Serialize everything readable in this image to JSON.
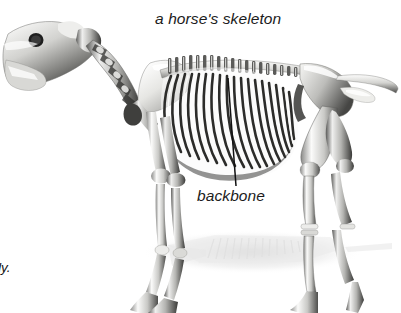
{
  "figure": {
    "title": "a horse's skeleton",
    "background_color": "#ffffff",
    "style": "grayscale 3D rendering"
  },
  "labels": {
    "backbone": "backbone"
  },
  "page_text_fragments": {
    "body_line": "ody.",
    "skeleton_line": "ton"
  },
  "colors": {
    "text": "#1c1c1c",
    "bone_light": "#f2f2f0",
    "bone_mid": "#b9b9b7",
    "bone_dark": "#4a4a4a",
    "bone_shade": "#2b2b2b",
    "shadow": "#d8d8d8",
    "leader_line": "#111111"
  },
  "anatomy_parts": [
    "skull",
    "cervical-vertebrae",
    "scapula",
    "thoracic-vertebrae",
    "ribcage",
    "lumbar-vertebrae",
    "pelvis",
    "tail-vertebrae",
    "femur",
    "front-legs",
    "hind-legs",
    "hooves",
    "ground-shadow"
  ],
  "leader_line": {
    "from_x": 228,
    "from_y": 78,
    "to_x": 236,
    "to_y": 186
  }
}
